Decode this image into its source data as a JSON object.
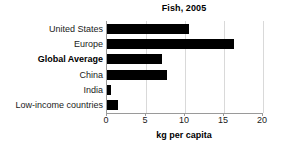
{
  "chart_data": {
    "type": "bar",
    "orientation": "horizontal",
    "title": "Fish, 2005",
    "xlabel": "kg per capita",
    "ylabel": "",
    "categories": [
      "United States",
      "Europe",
      "Global Average",
      "China",
      "India",
      "Low-income countries"
    ],
    "values": [
      10.5,
      16.3,
      7.0,
      7.7,
      0.5,
      1.4
    ],
    "emphasized_categories": [
      "Global Average"
    ],
    "xlim": [
      0,
      20
    ],
    "xticks": [
      0,
      5,
      10,
      15,
      20
    ],
    "xtick_labels": [
      "0",
      "5",
      "10",
      "15",
      "20"
    ],
    "grid": true,
    "grid_axis": "x",
    "legend": false,
    "bar_color": "#000000",
    "grid_color": "#d9d9d9",
    "axis_color": "#9a9a9a",
    "background_color": "#ffffff"
  }
}
